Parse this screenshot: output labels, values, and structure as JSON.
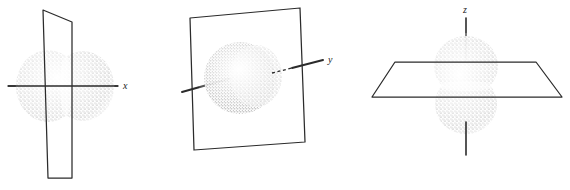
{
  "figure": {
    "title": "",
    "background_color": "#ffffff",
    "ink_color": "#2b2b2b",
    "orbital_stipple_color": "#8c8c8c",
    "width": 570,
    "height": 190,
    "panel_count": 3
  },
  "panels": [
    {
      "id": "panel-px",
      "orbital_name": "p-x orbital",
      "axis_label": "x",
      "axis_label_position": "right",
      "axis_orientation": "horizontal",
      "lobe_count": 2,
      "lobe_arrangement": "left-right along x axis",
      "nodal_plane_name": "yz-plane",
      "nodal_plane_shape": "parallelogram",
      "nodal_plane_orientation": "vertical",
      "axis_has_hidden_dashes": "false"
    },
    {
      "id": "panel-py",
      "orbital_name": "p-y orbital",
      "axis_label": "y",
      "axis_label_position": "right",
      "axis_orientation": "oblique into page",
      "lobe_count": 2,
      "lobe_arrangement": "front-back along y axis",
      "nodal_plane_name": "xz-plane",
      "nodal_plane_shape": "quadrilateral",
      "nodal_plane_orientation": "vertical",
      "axis_has_hidden_dashes": "true"
    },
    {
      "id": "panel-pz",
      "orbital_name": "p-z orbital",
      "axis_label": "z",
      "axis_label_position": "top",
      "axis_orientation": "vertical",
      "lobe_count": 2,
      "lobe_arrangement": "top-bottom along z axis",
      "nodal_plane_name": "xy-plane",
      "nodal_plane_shape": "trapezoid",
      "nodal_plane_orientation": "horizontal",
      "axis_has_hidden_dashes": "false"
    }
  ]
}
